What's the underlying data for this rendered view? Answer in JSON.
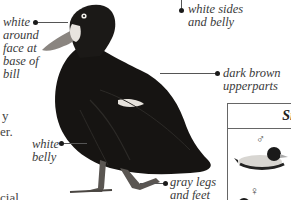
{
  "annotations": {
    "face": [
      "white",
      "around",
      "face at",
      "base of",
      "bill"
    ],
    "sides": [
      "white sides",
      "and belly"
    ],
    "upperparts": [
      "dark brown",
      "upperparts"
    ],
    "belly": [
      "white",
      "belly"
    ],
    "legs": [
      "gray legs",
      "and feet"
    ]
  },
  "body_text_fragments": [
    "y",
    "er.",
    "cial"
  ],
  "side_panel": {
    "title": "Si",
    "male_symbol": "♂",
    "female_symbol": "♀"
  },
  "colors": {
    "duck_body": "#161412",
    "text": "#3a3a3a",
    "leader_line": "#555555"
  }
}
